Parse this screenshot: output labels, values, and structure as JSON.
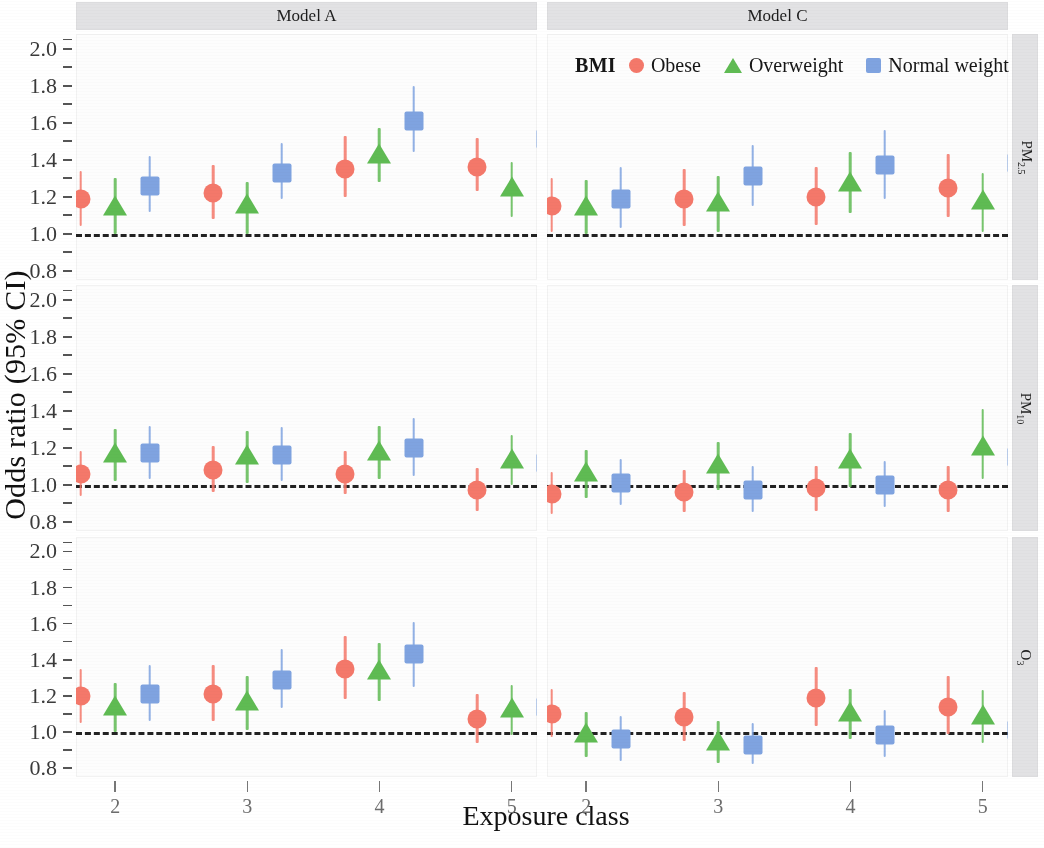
{
  "axes": {
    "ylabel": "Odds ratio (95% CI)",
    "xlabel": "Exposure class",
    "ylim": [
      0.75,
      2.08
    ],
    "yticks_major": [
      "0.8",
      "1.0",
      "1.2",
      "1.4",
      "1.6",
      "1.8",
      "2.0"
    ],
    "ytick_values": [
      0.8,
      1.0,
      1.2,
      1.4,
      1.6,
      1.8,
      2.0
    ],
    "ytick_minor_values": [
      0.9,
      1.1,
      1.3,
      1.5,
      1.7,
      1.9,
      2.05
    ],
    "reference_line": 1.0
  },
  "columns": [
    {
      "label": "Model A"
    },
    {
      "label": "Model C"
    }
  ],
  "rows": [
    {
      "label": "PM",
      "sub": "2.5"
    },
    {
      "label": "PM",
      "sub": "10"
    },
    {
      "label": "O",
      "sub": "3"
    }
  ],
  "legend": {
    "title": "BMI",
    "position": "top-right-inside-row1",
    "entries": [
      {
        "label": "Obese",
        "marker": "circle",
        "color": "#f4786a"
      },
      {
        "label": "Overweight",
        "marker": "triangle",
        "color": "#5fbb53"
      },
      {
        "label": "Normal weight",
        "marker": "square",
        "color": "#7fa3e0"
      }
    ]
  },
  "xticklabels": [
    "2",
    "3",
    "4",
    "5"
  ],
  "colors": {
    "obese": "#f4786a",
    "overweight": "#5fbb53",
    "normal_weight": "#7fa3e0",
    "reference_line": "#222222",
    "strip_background": "#e2e2e4",
    "panel_background": "#fdfdfd"
  },
  "chart_data": {
    "type": "scatter",
    "title": "",
    "subtitle": "",
    "xlabel": "Exposure class",
    "ylabel": "Odds ratio (95% CI)",
    "ylim": [
      0.75,
      2.08
    ],
    "grid": false,
    "legend_position": "top right of first row, right panel",
    "facet_rows": [
      "PM2.5",
      "PM10",
      "O3"
    ],
    "facet_cols": [
      "Model A",
      "Model C"
    ],
    "x": [
      2,
      3,
      4,
      5
    ],
    "reference_line": 1.0,
    "panels": [
      {
        "row": "PM2.5",
        "col": "Model A",
        "series": [
          {
            "name": "Obese",
            "marker": "circle",
            "color": "#f4786a",
            "values": [
              1.19,
              1.22,
              1.35,
              1.36
            ],
            "ci_low": [
              1.04,
              1.08,
              1.2,
              1.23
            ],
            "ci_high": [
              1.34,
              1.37,
              1.53,
              1.52
            ]
          },
          {
            "name": "Overweight",
            "marker": "triangle",
            "color": "#5fbb53",
            "values": [
              1.14,
              1.15,
              1.42,
              1.24
            ],
            "ci_low": [
              1.0,
              1.0,
              1.28,
              1.09
            ],
            "ci_high": [
              1.3,
              1.28,
              1.57,
              1.39
            ]
          },
          {
            "name": "Normal weight",
            "marker": "square",
            "color": "#7fa3e0",
            "values": [
              1.26,
              1.33,
              1.61,
              1.51
            ],
            "ci_low": [
              1.12,
              1.19,
              1.44,
              1.36
            ],
            "ci_high": [
              1.42,
              1.49,
              1.8,
              1.68
            ]
          }
        ]
      },
      {
        "row": "PM2.5",
        "col": "Model C",
        "series": [
          {
            "name": "Obese",
            "marker": "circle",
            "color": "#f4786a",
            "values": [
              1.15,
              1.19,
              1.2,
              1.25
            ],
            "ci_low": [
              1.01,
              1.04,
              1.05,
              1.09
            ],
            "ci_high": [
              1.3,
              1.35,
              1.36,
              1.43
            ]
          },
          {
            "name": "Overweight",
            "marker": "triangle",
            "color": "#5fbb53",
            "values": [
              1.14,
              1.16,
              1.27,
              1.17
            ],
            "ci_low": [
              1.0,
              1.01,
              1.11,
              1.01
            ],
            "ci_high": [
              1.29,
              1.31,
              1.44,
              1.33
            ]
          },
          {
            "name": "Normal weight",
            "marker": "square",
            "color": "#7fa3e0",
            "values": [
              1.19,
              1.31,
              1.37,
              1.38
            ],
            "ci_low": [
              1.03,
              1.15,
              1.19,
              1.2
            ],
            "ci_high": [
              1.36,
              1.48,
              1.56,
              1.58
            ]
          }
        ]
      },
      {
        "row": "PM10",
        "col": "Model A",
        "series": [
          {
            "name": "Obese",
            "marker": "circle",
            "color": "#f4786a",
            "values": [
              1.06,
              1.08,
              1.06,
              0.97
            ],
            "ci_low": [
              0.94,
              0.96,
              0.95,
              0.86
            ],
            "ci_high": [
              1.18,
              1.21,
              1.18,
              1.09
            ]
          },
          {
            "name": "Overweight",
            "marker": "triangle",
            "color": "#5fbb53",
            "values": [
              1.16,
              1.15,
              1.17,
              1.13
            ],
            "ci_low": [
              1.02,
              1.01,
              1.03,
              1.0
            ],
            "ci_high": [
              1.3,
              1.29,
              1.32,
              1.27
            ]
          },
          {
            "name": "Normal weight",
            "marker": "square",
            "color": "#7fa3e0",
            "values": [
              1.17,
              1.16,
              1.2,
              1.12
            ],
            "ci_low": [
              1.03,
              1.02,
              1.05,
              0.99
            ],
            "ci_high": [
              1.32,
              1.31,
              1.36,
              1.26
            ]
          }
        ]
      },
      {
        "row": "PM10",
        "col": "Model C",
        "series": [
          {
            "name": "Obese",
            "marker": "circle",
            "color": "#f4786a",
            "values": [
              0.95,
              0.96,
              0.98,
              0.97
            ],
            "ci_low": [
              0.84,
              0.85,
              0.86,
              0.85
            ],
            "ci_high": [
              1.07,
              1.08,
              1.1,
              1.1
            ]
          },
          {
            "name": "Overweight",
            "marker": "triangle",
            "color": "#5fbb53",
            "values": [
              1.06,
              1.1,
              1.13,
              1.2
            ],
            "ci_low": [
              0.93,
              0.97,
              0.99,
              1.03
            ],
            "ci_high": [
              1.19,
              1.23,
              1.28,
              1.41
            ]
          },
          {
            "name": "Normal weight",
            "marker": "square",
            "color": "#7fa3e0",
            "values": [
              1.01,
              0.97,
              1.0,
              1.15
            ],
            "ci_low": [
              0.89,
              0.85,
              0.88,
              1.0
            ],
            "ci_high": [
              1.14,
              1.1,
              1.13,
              1.31
            ]
          }
        ]
      },
      {
        "row": "O3",
        "col": "Model A",
        "series": [
          {
            "name": "Obese",
            "marker": "circle",
            "color": "#f4786a",
            "values": [
              1.2,
              1.21,
              1.35,
              1.07
            ],
            "ci_low": [
              1.05,
              1.06,
              1.18,
              0.94
            ],
            "ci_high": [
              1.35,
              1.37,
              1.53,
              1.21
            ]
          },
          {
            "name": "Overweight",
            "marker": "triangle",
            "color": "#5fbb53",
            "values": [
              1.13,
              1.16,
              1.33,
              1.12
            ],
            "ci_low": [
              1.0,
              1.01,
              1.17,
              0.98
            ],
            "ci_high": [
              1.27,
              1.31,
              1.49,
              1.26
            ]
          },
          {
            "name": "Normal weight",
            "marker": "square",
            "color": "#7fa3e0",
            "values": [
              1.21,
              1.29,
              1.43,
              1.14
            ],
            "ci_low": [
              1.06,
              1.13,
              1.25,
              1.0
            ],
            "ci_high": [
              1.37,
              1.46,
              1.61,
              1.29
            ]
          }
        ]
      },
      {
        "row": "O3",
        "col": "Model C",
        "series": [
          {
            "name": "Obese",
            "marker": "circle",
            "color": "#f4786a",
            "values": [
              1.1,
              1.08,
              1.19,
              1.14
            ],
            "ci_low": [
              0.97,
              0.95,
              1.03,
              0.99
            ],
            "ci_high": [
              1.24,
              1.22,
              1.36,
              1.31
            ]
          },
          {
            "name": "Overweight",
            "marker": "triangle",
            "color": "#5fbb53",
            "values": [
              0.98,
              0.94,
              1.1,
              1.08
            ],
            "ci_low": [
              0.86,
              0.83,
              0.96,
              0.94
            ],
            "ci_high": [
              1.11,
              1.06,
              1.24,
              1.23
            ]
          },
          {
            "name": "Normal weight",
            "marker": "square",
            "color": "#7fa3e0",
            "values": [
              0.96,
              0.93,
              0.98,
              1.01
            ],
            "ci_low": [
              0.84,
              0.82,
              0.86,
              0.88
            ],
            "ci_high": [
              1.09,
              1.05,
              1.12,
              1.15
            ]
          }
        ]
      }
    ]
  }
}
